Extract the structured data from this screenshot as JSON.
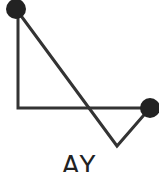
{
  "diagram": {
    "label": "AY",
    "stroke_color": "#333333",
    "node_color": "#222222",
    "points": {
      "top_left": {
        "x": 16,
        "y": 9
      },
      "corner": {
        "x": 18,
        "y": 108
      },
      "right": {
        "x": 150,
        "y": 108
      },
      "bottom": {
        "x": 117,
        "y": 146
      }
    }
  }
}
